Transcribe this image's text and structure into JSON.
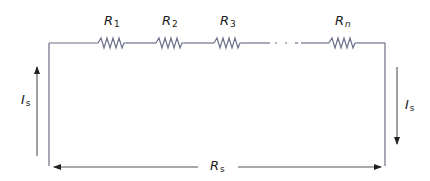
{
  "diagram": {
    "type": "series-resistor-circuit",
    "resistors": [
      {
        "symbol": "R",
        "subscript": "1"
      },
      {
        "symbol": "R",
        "subscript": "2"
      },
      {
        "symbol": "R",
        "subscript": "3"
      },
      {
        "symbol": "R",
        "subscript": "n"
      }
    ],
    "ellipsis": "· · ·",
    "current_left": {
      "symbol": "I",
      "subscript": "s",
      "direction": "up"
    },
    "current_right": {
      "symbol": "I",
      "subscript": "s",
      "direction": "down"
    },
    "equivalent": {
      "symbol": "R",
      "subscript": "s",
      "direction": "both"
    },
    "colors": {
      "wire": "#6b6f86",
      "arrow": "#333333",
      "text": "#1a1a1a"
    }
  }
}
